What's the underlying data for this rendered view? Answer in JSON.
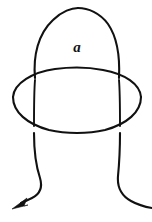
{
  "figure": {
    "type": "line-drawing",
    "background_color": "#ffffff",
    "stroke_color": "#111111",
    "stroke_width": 2.1,
    "width": 152,
    "height": 222,
    "labels": [
      {
        "id": "loop-label-a",
        "text": "a",
        "style": "bold-italic-serif",
        "x": 77,
        "y": 52
      }
    ],
    "components": [
      {
        "id": "loop-arch",
        "name": "loop-bight-arch",
        "description": "Tall rounded arch forming the upper bight of the knot"
      },
      {
        "id": "encircling-ellipse",
        "name": "encircling-ellipse",
        "description": "Horizontal ellipse passing around the loop, drawn in front at top and bottom arcs"
      },
      {
        "id": "left-strand",
        "name": "left-descending-strand",
        "description": "Left strand descending below the ellipse and curving to the arrowhead"
      },
      {
        "id": "right-strand",
        "name": "right-descending-strand",
        "description": "Right strand descending below the ellipse and curving off to the right edge"
      },
      {
        "id": "arrow-head",
        "name": "orientation-arrowhead",
        "description": "Solid filled triangular arrowhead pointing down and to the left",
        "direction": "down-left",
        "x": 18,
        "y": 204
      }
    ]
  }
}
